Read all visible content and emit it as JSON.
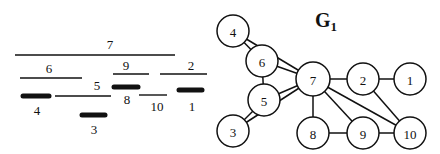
{
  "colors": {
    "ink": "#111111",
    "background": "#ffffff",
    "node_fill": "#ffffff"
  },
  "interval_diagram": {
    "intervals": [
      {
        "id": "7",
        "label": "7",
        "x1": 15,
        "x2": 175,
        "y": 55,
        "thick": false,
        "lx": 110,
        "ly": 49
      },
      {
        "id": "6",
        "label": "6",
        "x1": 20,
        "x2": 82,
        "y": 78,
        "thick": false,
        "lx": 49,
        "ly": 73
      },
      {
        "id": "9",
        "label": "9",
        "x1": 113,
        "x2": 149,
        "y": 74,
        "thick": false,
        "lx": 126,
        "ly": 70
      },
      {
        "id": "2",
        "label": "2",
        "x1": 160,
        "x2": 207,
        "y": 74,
        "thick": false,
        "lx": 191,
        "ly": 70
      },
      {
        "id": "5",
        "label": "5",
        "x1": 55,
        "x2": 111,
        "y": 96,
        "thick": false,
        "lx": 97,
        "ly": 90
      },
      {
        "id": "4",
        "label": "4",
        "x1": 23,
        "x2": 49,
        "y": 96,
        "thick": true,
        "lx": 37,
        "ly": 115
      },
      {
        "id": "3",
        "label": "3",
        "x1": 82,
        "x2": 105,
        "y": 115,
        "thick": true,
        "lx": 94,
        "ly": 134
      },
      {
        "id": "8",
        "label": "8",
        "x1": 114,
        "x2": 138,
        "y": 87,
        "thick": true,
        "lx": 127,
        "ly": 104
      },
      {
        "id": "10",
        "label": "10",
        "x1": 139,
        "x2": 167,
        "y": 95,
        "thick": false,
        "lx": 157,
        "ly": 111
      },
      {
        "id": "1",
        "label": "1",
        "x1": 179,
        "x2": 202,
        "y": 90,
        "thick": true,
        "lx": 192,
        "ly": 111
      }
    ]
  },
  "graph": {
    "title": "G",
    "title_subscript": "1",
    "node_radius": 16,
    "nodes": [
      {
        "id": "4",
        "label": "4",
        "x": 233,
        "y": 31
      },
      {
        "id": "6",
        "label": "6",
        "x": 262,
        "y": 61
      },
      {
        "id": "7",
        "label": "7",
        "x": 313,
        "y": 79
      },
      {
        "id": "5",
        "label": "5",
        "x": 264,
        "y": 100
      },
      {
        "id": "3",
        "label": "3",
        "x": 233,
        "y": 131
      },
      {
        "id": "2",
        "label": "2",
        "x": 363,
        "y": 79
      },
      {
        "id": "1",
        "label": "1",
        "x": 410,
        "y": 79
      },
      {
        "id": "8",
        "label": "8",
        "x": 313,
        "y": 133
      },
      {
        "id": "9",
        "label": "9",
        "x": 363,
        "y": 133
      },
      {
        "id": "10",
        "label": "10",
        "x": 410,
        "y": 133
      }
    ],
    "edges": [
      [
        "4",
        "6"
      ],
      [
        "4",
        "7"
      ],
      [
        "6",
        "7"
      ],
      [
        "6",
        "5"
      ],
      [
        "5",
        "7"
      ],
      [
        "5",
        "3"
      ],
      [
        "3",
        "7"
      ],
      [
        "7",
        "8"
      ],
      [
        "7",
        "2"
      ],
      [
        "7",
        "9"
      ],
      [
        "7",
        "10"
      ],
      [
        "2",
        "1"
      ],
      [
        "2",
        "10"
      ],
      [
        "8",
        "9"
      ],
      [
        "9",
        "10"
      ]
    ]
  }
}
